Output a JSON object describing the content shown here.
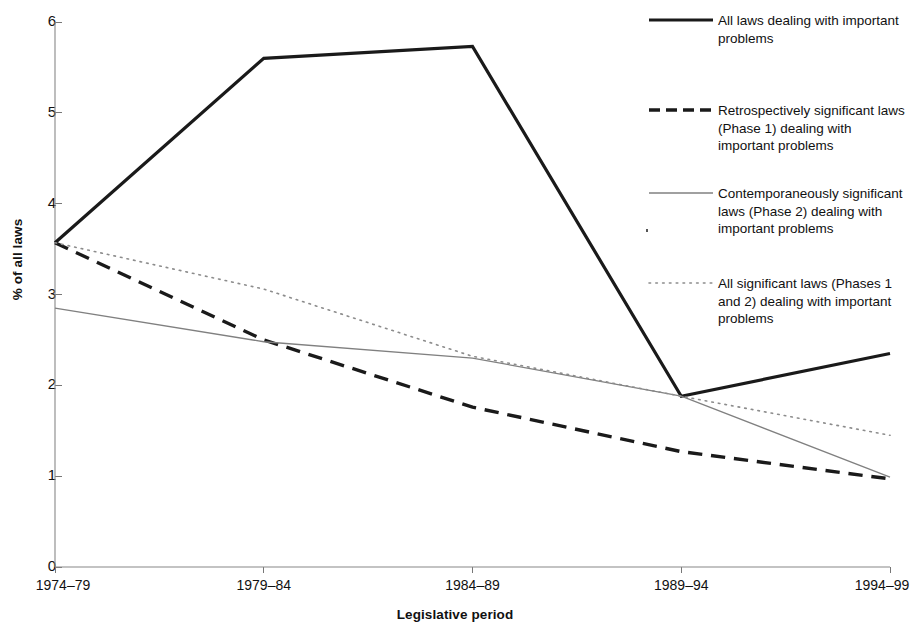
{
  "chart_data": {
    "type": "line",
    "title": "",
    "xlabel": "Legislative period",
    "ylabel": "% of all laws",
    "categories": [
      "1974–79",
      "1979–84",
      "1984–89",
      "1989–94",
      "1994–99"
    ],
    "ylim": [
      0,
      6
    ],
    "yticks": [
      0,
      1,
      2,
      3,
      4,
      5,
      6
    ],
    "grid": false,
    "legend_position": "right",
    "series": [
      {
        "name": "All laws dealing with important problems",
        "values": [
          3.57,
          5.6,
          5.73,
          1.88,
          2.35
        ],
        "style": "solid",
        "color": "#1a1a1a",
        "width": 3.2
      },
      {
        "name": "Retrospectively significant laws (Phase 1) dealing with important problems",
        "values": [
          3.57,
          2.5,
          1.76,
          1.27,
          0.97
        ],
        "style": "dashed",
        "color": "#1a1a1a",
        "width": 3.4
      },
      {
        "name": "Contemporaneously significant laws (Phase 2) dealing with important problems",
        "values": [
          2.85,
          2.48,
          2.3,
          1.88,
          0.99
        ],
        "style": "solid",
        "color": "#808080",
        "width": 1.3
      },
      {
        "name": "All significant laws (Phases 1 and 2) dealing with important problems",
        "values": [
          3.57,
          3.06,
          2.32,
          1.88,
          1.45
        ],
        "style": "dotted",
        "color": "#8c8c8c",
        "width": 1.6
      }
    ]
  },
  "axis": {
    "y_title": "% of all laws",
    "x_title": "Legislative period",
    "y_tick_labels": [
      "6",
      "5",
      "4",
      "3",
      "2",
      "1",
      "0"
    ],
    "x_tick_labels": [
      "1974–79",
      "1979–84",
      "1984–89",
      "1989–94",
      "1994–99"
    ]
  },
  "legend": {
    "items": [
      {
        "label": "All laws dealing with important problems",
        "style": "solid",
        "color": "#1a1a1a"
      },
      {
        "label": "Retrospectively significant laws (Phase 1) dealing with important problems",
        "style": "dashed",
        "color": "#1a1a1a"
      },
      {
        "label": "Contemporaneously significant laws (Phase 2) dealing with important problems",
        "style": "solid",
        "color": "#808080"
      },
      {
        "label": "All significant laws (Phases 1 and 2) dealing with important problems",
        "style": "dotted",
        "color": "#8c8c8c"
      }
    ]
  },
  "colors": {
    "axis": "#777777",
    "text": "#111111",
    "background": "#ffffff"
  }
}
